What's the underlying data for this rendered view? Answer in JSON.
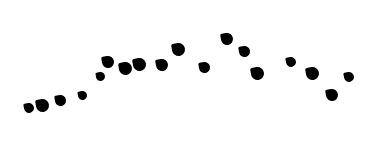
{
  "background": "#ffffff",
  "shape_color": "#000000",
  "shapes": [
    {
      "x": 29,
      "y": 108,
      "size": 10
    },
    {
      "x": 42,
      "y": 105,
      "size": 13
    },
    {
      "x": 60,
      "y": 100,
      "size": 11
    },
    {
      "x": 82,
      "y": 95,
      "size": 9
    },
    {
      "x": 100,
      "y": 76,
      "size": 9
    },
    {
      "x": 108,
      "y": 62,
      "size": 12
    },
    {
      "x": 125,
      "y": 68,
      "size": 13
    },
    {
      "x": 139,
      "y": 64,
      "size": 13
    },
    {
      "x": 162,
      "y": 65,
      "size": 12
    },
    {
      "x": 178,
      "y": 49,
      "size": 13
    },
    {
      "x": 204,
      "y": 67,
      "size": 11
    },
    {
      "x": 227,
      "y": 39,
      "size": 12
    },
    {
      "x": 244,
      "y": 51,
      "size": 11
    },
    {
      "x": 257,
      "y": 73,
      "size": 13
    },
    {
      "x": 291,
      "y": 62,
      "size": 10
    },
    {
      "x": 312,
      "y": 73,
      "size": 13
    },
    {
      "x": 332,
      "y": 95,
      "size": 12
    },
    {
      "x": 349,
      "y": 77,
      "size": 10
    }
  ]
}
